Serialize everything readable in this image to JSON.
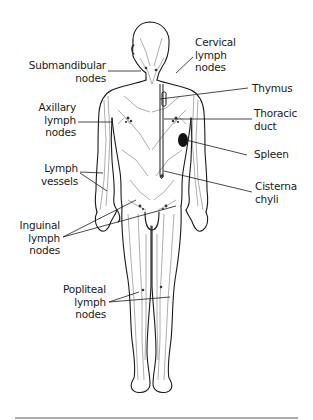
{
  "diagram": {
    "colors": {
      "line": "#1a1a1a",
      "vessel": "#6a6a6a",
      "spleen": "#111111",
      "background": "#ffffff",
      "rule": "#555555"
    },
    "labels": {
      "submandibular": "Submandibular\nnodes",
      "axillary": "Axillary\nlymph\nnodes",
      "lymph_vessels": "Lymph\nvessels",
      "inguinal": "Inguinal\nlymph\nnodes",
      "popliteal": "Popliteal\nlymph\nnodes",
      "cervical": "Cervical\nlymph\nnodes",
      "thymus": "Thymus",
      "thoracic_duct": "Thoracic\nduct",
      "spleen": "Spleen",
      "cisterna_chyli": "Cisterna\nchyli"
    }
  }
}
